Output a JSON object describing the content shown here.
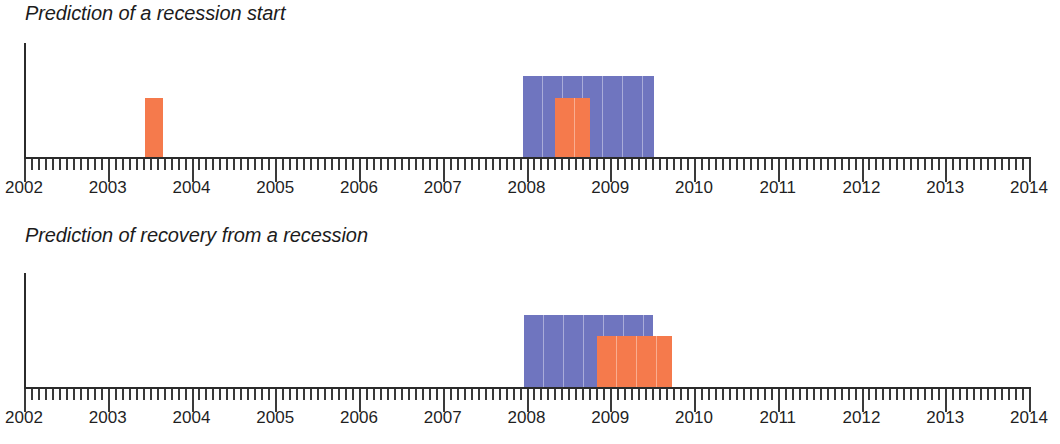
{
  "figure": {
    "background_color": "#ffffff",
    "series_colors": {
      "blue": "#6f75bf",
      "orange": "#f57a4c"
    }
  },
  "panels": [
    {
      "title": "Prediction of a recession start",
      "axis": {
        "x_min": 2002,
        "x_max": 2014
      },
      "x_tick_labels": [
        "2002",
        "2003",
        "2004",
        "2005",
        "2006",
        "2007",
        "2008",
        "2009",
        "2010",
        "2011",
        "2012",
        "2013",
        "2014"
      ]
    },
    {
      "title": "Prediction of recovery from a recession",
      "axis": {
        "x_min": 2002,
        "x_max": 2014
      },
      "x_tick_labels": [
        "2002",
        "2003",
        "2004",
        "2005",
        "2006",
        "2007",
        "2008",
        "2009",
        "2010",
        "2011",
        "2012",
        "2013",
        "2014"
      ]
    }
  ],
  "chart_data": [
    {
      "type": "bar",
      "title": "Prediction of a recession start",
      "xlabel": "",
      "ylabel": "",
      "xlim": [
        2002,
        2014
      ],
      "ylim": [
        0,
        1.4
      ],
      "grid": false,
      "legend": "none",
      "x_tick_labels": [
        "2002",
        "2003",
        "2004",
        "2005",
        "2006",
        "2007",
        "2008",
        "2009",
        "2010",
        "2011",
        "2012",
        "2013",
        "2014"
      ],
      "x_minor_tick_interval_years": 0.0833,
      "bars": [
        {
          "series": "orange",
          "x_start": 2003.45,
          "x_end": 2003.66,
          "height": 0.72,
          "color": "#f57a4c"
        },
        {
          "series": "blue",
          "x_start": 2007.96,
          "x_end": 2009.52,
          "height": 1.0,
          "color": "#6f75bf"
        },
        {
          "series": "orange",
          "x_start": 2008.34,
          "x_end": 2008.76,
          "height": 0.72,
          "color": "#f57a4c"
        }
      ]
    },
    {
      "type": "bar",
      "title": "Prediction of recovery from a recession",
      "xlabel": "",
      "ylabel": "",
      "xlim": [
        2002,
        2014
      ],
      "ylim": [
        0,
        1.4
      ],
      "grid": false,
      "legend": "none",
      "x_tick_labels": [
        "2002",
        "2003",
        "2004",
        "2005",
        "2006",
        "2007",
        "2008",
        "2009",
        "2010",
        "2011",
        "2012",
        "2013",
        "2014"
      ],
      "x_minor_tick_interval_years": 0.0833,
      "bars": [
        {
          "series": "blue",
          "x_start": 2007.97,
          "x_end": 2009.51,
          "height": 0.886,
          "color": "#6f75bf"
        },
        {
          "series": "orange",
          "x_start": 2008.84,
          "x_end": 2009.74,
          "height": 0.632,
          "color": "#f57a4c"
        }
      ]
    }
  ]
}
